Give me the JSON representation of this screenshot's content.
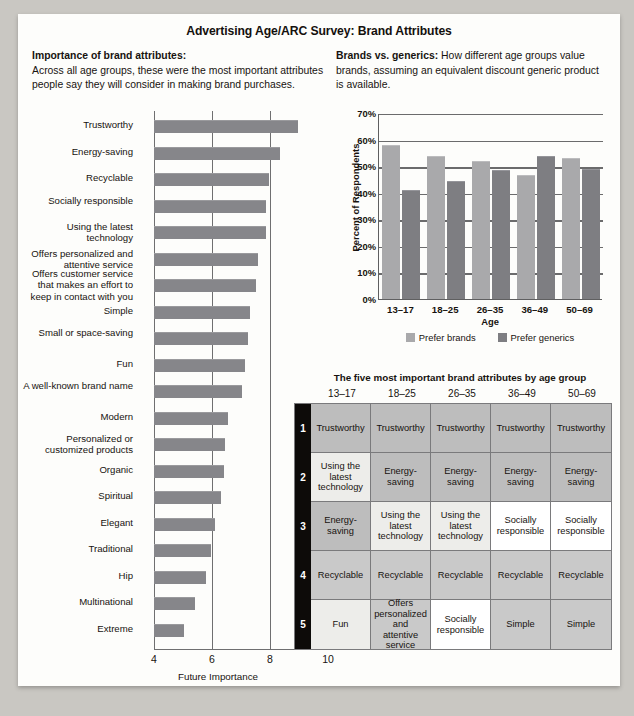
{
  "title": "Advertising Age/ARC Survey: Brand Attributes",
  "intro_left": {
    "lead": "Importance of brand attributes:",
    "body": "Across all age groups, these were the most important attributes people say they will consider in making brand purchases."
  },
  "intro_right": {
    "lead": "Brands vs. generics:",
    "body": "How different age groups value brands, assuming an equivalent discount generic product is available."
  },
  "chart_data": [
    {
      "type": "bar",
      "orientation": "horizontal",
      "title": "Importance of brand attributes",
      "xlabel": "Future Importance",
      "ylabel": "",
      "xlim": [
        4,
        10
      ],
      "xticks": [
        "4",
        "6",
        "8",
        "10"
      ],
      "gridlines": [
        6,
        8
      ],
      "categories": [
        "Trustworthy",
        "Energy-saving",
        "Recyclable",
        "Socially responsible",
        "Using the latest technology",
        "Offers personalized and attentive service",
        "Offers customer service that makes an effort to keep in contact with you",
        "Simple",
        "Small or space-saving",
        "Fun",
        "A well-known brand name",
        "Modern",
        "Personalized or customized products",
        "Organic",
        "Spiritual",
        "Elegant",
        "Traditional",
        "Hip",
        "Multinational",
        "Extreme"
      ],
      "values": [
        8.95,
        8.35,
        7.95,
        7.85,
        7.85,
        7.6,
        7.5,
        7.3,
        7.25,
        7.15,
        7.05,
        6.55,
        6.45,
        6.4,
        6.3,
        6.1,
        5.98,
        5.8,
        5.4,
        5.05
      ]
    },
    {
      "type": "bar",
      "orientation": "vertical",
      "title": "Brands vs. generics",
      "xlabel": "Age",
      "ylabel": "Percent of Respondents",
      "ylim": [
        0,
        70
      ],
      "yticks": [
        "0%",
        "10%",
        "20%",
        "30%",
        "40%",
        "50%",
        "60%",
        "70%"
      ],
      "categories": [
        "13–17",
        "18–25",
        "26–35",
        "36–49",
        "50–69"
      ],
      "series": [
        {
          "name": "Prefer brands",
          "values": [
            58,
            54,
            52,
            46.5,
            53
          ],
          "color": "#a9a9ab"
        },
        {
          "name": "Prefer generics",
          "values": [
            41,
            44.5,
            48.5,
            54,
            49
          ],
          "color": "#7e7e82"
        }
      ]
    }
  ],
  "table": {
    "title": "The five most important brand attributes by age group",
    "columns": [
      "13–17",
      "18–25",
      "26–35",
      "36–49",
      "50–69"
    ],
    "ranks": [
      "1",
      "2",
      "3",
      "4",
      "5"
    ],
    "rows": [
      {
        "rank": "1",
        "cells": [
          {
            "text": "Trustworthy",
            "shade": "s-dark"
          },
          {
            "text": "Trustworthy",
            "shade": "s-dark"
          },
          {
            "text": "Trustworthy",
            "shade": "s-dark"
          },
          {
            "text": "Trustworthy",
            "shade": "s-dark"
          },
          {
            "text": "Trustworthy",
            "shade": "s-dark"
          }
        ]
      },
      {
        "rank": "2",
        "cells": [
          {
            "text": "Using the latest technology",
            "shade": "s-light"
          },
          {
            "text": "Energy-saving",
            "shade": "s-dark"
          },
          {
            "text": "Energy-saving",
            "shade": "s-dark"
          },
          {
            "text": "Energy-saving",
            "shade": "s-dark"
          },
          {
            "text": "Energy-saving",
            "shade": "s-dark"
          }
        ]
      },
      {
        "rank": "3",
        "cells": [
          {
            "text": "Energy-saving",
            "shade": "s-dark"
          },
          {
            "text": "Using the latest technology",
            "shade": "s-light"
          },
          {
            "text": "Using the latest technology",
            "shade": "s-light"
          },
          {
            "text": "Socially responsible",
            "shade": "s-white"
          },
          {
            "text": "Socially responsible",
            "shade": "s-white"
          }
        ]
      },
      {
        "rank": "4",
        "cells": [
          {
            "text": "Recyclable",
            "shade": "s-mid"
          },
          {
            "text": "Recyclable",
            "shade": "s-mid"
          },
          {
            "text": "Recyclable",
            "shade": "s-mid"
          },
          {
            "text": "Recyclable",
            "shade": "s-mid"
          },
          {
            "text": "Recyclable",
            "shade": "s-mid"
          }
        ]
      },
      {
        "rank": "5",
        "cells": [
          {
            "text": "Fun",
            "shade": "s-light"
          },
          {
            "text": "Offers personalized and attentive service",
            "shade": "s-mid"
          },
          {
            "text": "Socially responsible",
            "shade": "s-white"
          },
          {
            "text": "Simple",
            "shade": "s-mid"
          },
          {
            "text": "Simple",
            "shade": "s-mid"
          }
        ]
      }
    ]
  }
}
